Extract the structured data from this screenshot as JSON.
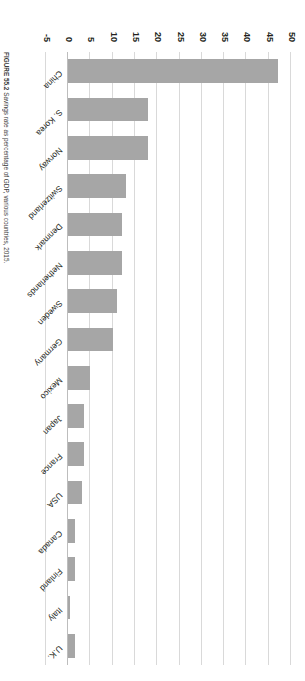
{
  "figure": {
    "caption_number": "FIGURE 55.2",
    "caption_text": "Savings rate as percentage of GDP, various countries, 2015."
  },
  "axis": {
    "tick_labels": [
      "-5",
      "0",
      "5",
      "10",
      "15",
      "20",
      "25",
      "30",
      "35",
      "40",
      "45",
      "50"
    ],
    "min": -5,
    "max": 50,
    "step": 5,
    "ylabel": "",
    "xlabel": ""
  },
  "style": {
    "bar_color": "#a6a6a6",
    "grid_color": "#d9d9d9",
    "text_color": "#231f20",
    "background": "#ffffff"
  },
  "chart_data": {
    "type": "bar",
    "orientation": "vertical",
    "title": "",
    "subtitle": "",
    "xlabel": "",
    "ylabel": "",
    "ylim": [
      -5,
      50
    ],
    "grid": true,
    "legend": false,
    "categories": [
      "China",
      "S. Korea",
      "Norway",
      "Switzerland",
      "Denmark",
      "Netherlands",
      "Sweden",
      "Germany",
      "Mexico",
      "Japan",
      "France",
      "USA",
      "Canada",
      "Finland",
      "Italy",
      "U.K."
    ],
    "values": [
      47,
      18,
      18,
      13,
      12,
      12,
      11,
      10,
      5,
      3.5,
      3.5,
      3,
      1.5,
      1.5,
      0.3,
      1.5
    ],
    "series": [
      {
        "name": "Savings rate (% of GDP)",
        "values": [
          47,
          18,
          18,
          13,
          12,
          12,
          11,
          10,
          5,
          3.5,
          3.5,
          3,
          1.5,
          1.5,
          0.3,
          1.5
        ]
      }
    ]
  }
}
